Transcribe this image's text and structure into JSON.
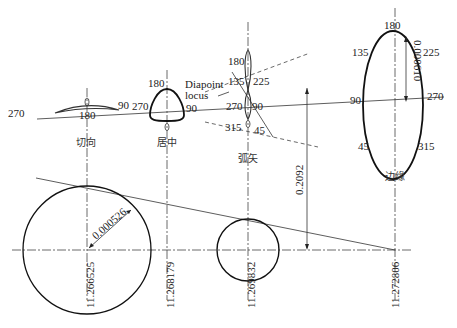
{
  "diagram": {
    "stations": [
      {
        "name": "切向",
        "position": "11.266525",
        "angles": {
          "left": "270",
          "bottom": "180",
          "right": "90"
        }
      },
      {
        "name": "居中",
        "position": "11.268179",
        "angles": {
          "top": "180",
          "left": "270",
          "right": "90"
        }
      },
      {
        "name": "弧矢",
        "position": "11.269832",
        "angles": {
          "top": "180",
          "upper_left": "135",
          "upper_right": "225",
          "left": "270",
          "right": "90",
          "lower_left": "315",
          "lower_right": "45"
        }
      },
      {
        "name": "边缘",
        "position": "11.272806",
        "angles": {
          "top": "180",
          "upper_left": "135",
          "upper_right": "225",
          "left": "90",
          "right": "270",
          "lower_left": "45",
          "lower_right": "315"
        }
      }
    ],
    "annotations": {
      "diapoint_line1": "Diapoint",
      "diapoint_line2": "locus",
      "radius_dim": "0.000526",
      "ellipse_dim": "0.000610",
      "height_dim": "0.2092"
    }
  }
}
